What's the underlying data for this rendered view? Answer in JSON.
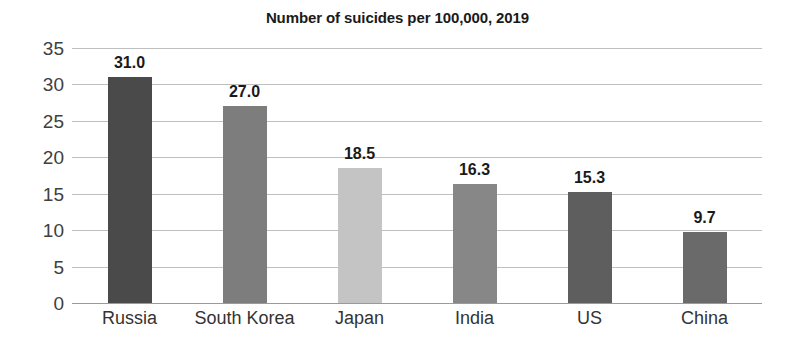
{
  "chart_data": {
    "type": "bar",
    "title": "Number of suicides per 100,000, 2019",
    "xlabel": "",
    "ylabel": "",
    "categories": [
      "Russia",
      "South Korea",
      "Japan",
      "India",
      "US",
      "China"
    ],
    "values": [
      31.0,
      27.0,
      18.5,
      16.3,
      15.3,
      9.7
    ],
    "value_labels": [
      "31.0",
      "27.0",
      "18.5",
      "16.3",
      "15.3",
      "9.7"
    ],
    "bar_colors": [
      "#4a4a4a",
      "#7d7d7d",
      "#c4c4c4",
      "#878787",
      "#5e5e5e",
      "#6a6a6a"
    ],
    "ylim": [
      0,
      35
    ],
    "yticks": [
      0,
      5,
      10,
      15,
      20,
      25,
      30,
      35
    ],
    "ytick_labels": [
      "0",
      "5",
      "10",
      "15",
      "20",
      "25",
      "30",
      "35"
    ],
    "grid": true,
    "legend": false,
    "background": "#ffffff",
    "gridline_color": "#bfbfbf"
  }
}
